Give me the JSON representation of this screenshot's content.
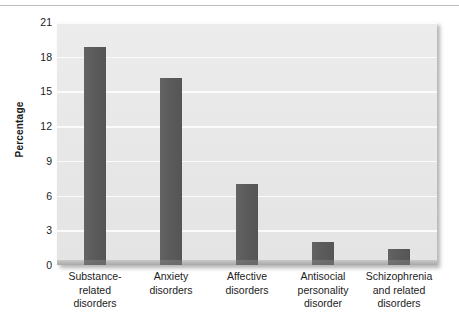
{
  "chart_data": {
    "type": "bar",
    "title": "",
    "xlabel": "",
    "ylabel": "Percentage",
    "categories": [
      "Substance-related disorders",
      "Anxiety disorders",
      "Affective disorders",
      "Antisocial personality disorder",
      "Schizophrenia and related disorders"
    ],
    "category_lines": [
      [
        "Substance-",
        "related",
        "disorders"
      ],
      [
        "Anxiety",
        "disorders"
      ],
      [
        "Affective",
        "disorders"
      ],
      [
        "Antisocial",
        "personality",
        "disorder"
      ],
      [
        "Schizophrenia",
        "and related",
        "disorders"
      ]
    ],
    "values": [
      18.8,
      16.2,
      7.0,
      2.0,
      1.4
    ],
    "ylim": [
      0,
      21
    ],
    "yticks": [
      0,
      3,
      6,
      9,
      12,
      15,
      18,
      21
    ],
    "ytick_labels": [
      "0",
      "3",
      "6",
      "9",
      "12",
      "15",
      "18",
      "21"
    ],
    "grid": true,
    "legend": null,
    "colors": {
      "bar": "#5e5e5e",
      "panel_background": "#e9e9e9",
      "gridline": "#fbfbfb",
      "text": "#1c1c1c",
      "top_rule": "#b9bcc0",
      "page_background": "#ffffff"
    }
  }
}
